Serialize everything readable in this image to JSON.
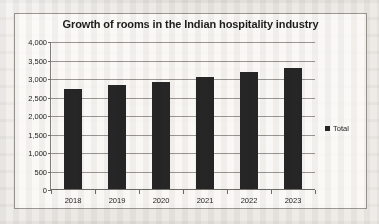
{
  "chart_data": {
    "type": "bar",
    "title": "Growth of rooms in the Indian hospitality industry",
    "xlabel": "",
    "ylabel": "",
    "categories": [
      "2018",
      "2019",
      "2020",
      "2021",
      "2022",
      "2023"
    ],
    "series": [
      {
        "name": "Total",
        "values": [
          2700,
          2800,
          2900,
          3030,
          3150,
          3280
        ]
      }
    ],
    "ylim": [
      0,
      4000
    ],
    "ytick_labels": [
      "4,000",
      "3,500",
      "3,000",
      "2,500",
      "2,000",
      "1,500",
      "1,000",
      "500",
      "0"
    ],
    "ytick_values": [
      4000,
      3500,
      3000,
      2500,
      2000,
      1500,
      1000,
      500,
      0
    ],
    "grid": true,
    "legend_position": "right",
    "bar_color": "#262626",
    "gridline_color": "#9a9792",
    "text_color": "#1d1d1b"
  },
  "legend": {
    "entries": [
      {
        "label": "Total",
        "color": "#262626",
        "marker": "square-marker-icon"
      }
    ]
  }
}
